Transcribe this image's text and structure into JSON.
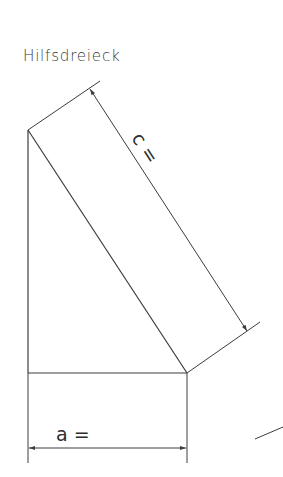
{
  "diagram": {
    "title": "Hilfsdreieck",
    "labels": {
      "hypotenuse": "c =",
      "base": "a ="
    },
    "colors": {
      "line": "#3c3c3c",
      "background": "#ffffff"
    }
  }
}
